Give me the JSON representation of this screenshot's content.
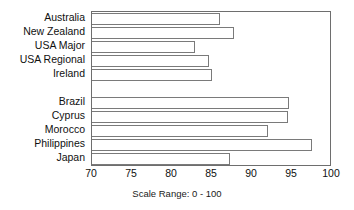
{
  "chart_data": {
    "type": "bar",
    "orientation": "horizontal",
    "title": "",
    "xlabel": "",
    "ylabel": "",
    "xlim": [
      70,
      100
    ],
    "xticks": [
      70,
      75,
      80,
      85,
      90,
      95,
      100
    ],
    "xtick_labels": [
      "70",
      "75",
      "80",
      "85",
      "90",
      "95",
      "100"
    ],
    "grid": false,
    "legend": false,
    "caption": "Scale Range:  0 - 100",
    "groups": [
      {
        "name": "group-1",
        "categories": [
          "Australia",
          "New Zealand",
          "USA Major",
          "USA Regional",
          "Ireland"
        ],
        "values": [
          86.0,
          87.7,
          82.9,
          84.6,
          85.0
        ]
      },
      {
        "name": "group-2",
        "categories": [
          "Brazil",
          "Cyprus",
          "Morocco",
          "Philippines",
          "Japan"
        ],
        "values": [
          94.6,
          94.5,
          92.0,
          97.5,
          87.2
        ]
      }
    ],
    "categories": [
      "Australia",
      "New Zealand",
      "USA Major",
      "USA Regional",
      "Ireland",
      "Brazil",
      "Cyprus",
      "Morocco",
      "Philippines",
      "Japan"
    ],
    "values": [
      86.0,
      87.7,
      82.9,
      84.6,
      85.0,
      94.6,
      94.5,
      92.0,
      97.5,
      87.2
    ],
    "colors": {
      "bar_fill": "#ffffff",
      "bar_stroke": "#7a7a7a",
      "axis": "#6e6e6e",
      "text": "#101010",
      "background": "#ffffff"
    }
  }
}
